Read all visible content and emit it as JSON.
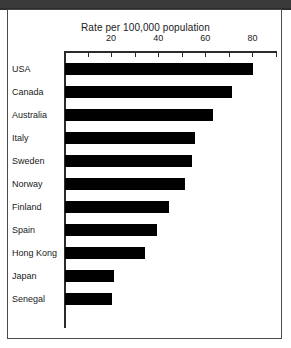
{
  "chart": {
    "title": "Rate per 100,000 population",
    "axis_ticks": [
      0,
      10,
      20,
      30,
      40,
      50,
      60,
      70,
      80,
      90
    ],
    "labeled_ticks": [
      20,
      40,
      60,
      80
    ],
    "bar_color": "#000000",
    "frame_color": "#4a4a4a",
    "axis_color": "#2b2b2b"
  },
  "chart_data": {
    "type": "bar",
    "orientation": "horizontal",
    "title": "Rate per 100,000 population",
    "xlabel": "Rate per 100,000 population",
    "ylabel": "",
    "xlim": [
      0,
      90
    ],
    "grid": false,
    "legend": "none",
    "categories": [
      "USA",
      "Canada",
      "Australia",
      "Italy",
      "Sweden",
      "Norway",
      "Finland",
      "Spain",
      "Hong Kong",
      "Japan",
      "Senegal"
    ],
    "values": [
      80,
      71,
      63,
      55,
      54,
      51,
      44,
      39,
      34,
      21,
      20
    ],
    "tick_labels": [
      "20",
      "40",
      "60",
      "80"
    ],
    "tick_values": [
      20,
      40,
      60,
      80
    ]
  }
}
